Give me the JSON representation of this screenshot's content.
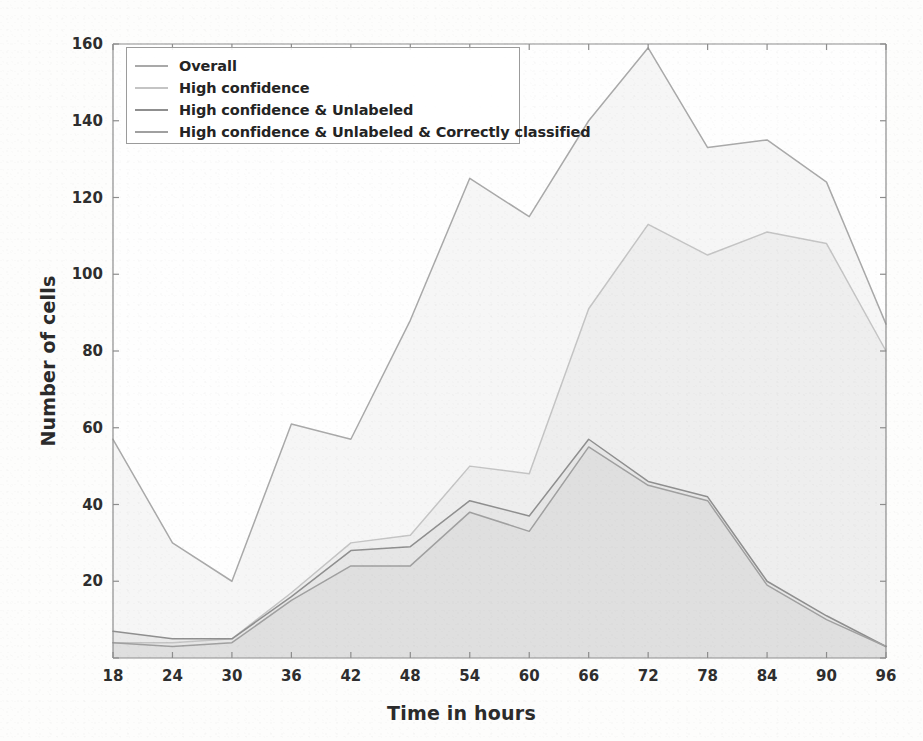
{
  "figure": {
    "background_color": "#fdfdfc",
    "axes_color": "#8d8d8d",
    "tick_text_color": "#2e2e2e"
  },
  "legend": {
    "position": "upper-left",
    "border_color": "#9b9b9b",
    "entries": [
      {
        "label": "Overall",
        "color": "#a9a9a9"
      },
      {
        "label": "High confidence",
        "color": "#c4c4c4"
      },
      {
        "label": "High confidence & Unlabeled",
        "color": "#8f8f8f"
      },
      {
        "label": "High confidence & Unlabeled & Correctly classified",
        "color": "#a0a0a0"
      }
    ]
  },
  "chart_data": {
    "type": "area",
    "title": "",
    "xlabel": "Time in hours",
    "ylabel": "Number of cells",
    "xlim": [
      18,
      96
    ],
    "ylim": [
      0,
      160
    ],
    "xticks": [
      18,
      24,
      30,
      36,
      42,
      48,
      54,
      60,
      66,
      72,
      78,
      84,
      90,
      96
    ],
    "yticks": [
      0,
      20,
      40,
      60,
      80,
      100,
      120,
      140,
      160
    ],
    "xtick_labels": [
      "18",
      "24",
      "30",
      "36",
      "42",
      "48",
      "54",
      "60",
      "66",
      "72",
      "78",
      "84",
      "90",
      "96"
    ],
    "ytick_labels": [
      "0",
      "20",
      "40",
      "60",
      "80",
      "100",
      "120",
      "140",
      "160"
    ],
    "grid": false,
    "legend_position": "upper left",
    "x": [
      18,
      24,
      30,
      36,
      42,
      48,
      54,
      60,
      66,
      72,
      78,
      84,
      90,
      96
    ],
    "series": [
      {
        "name": "Overall",
        "color": "#a9a9a9",
        "fill": "#f2f2f2",
        "values": [
          57,
          30,
          20,
          61,
          57,
          88,
          125,
          115,
          140,
          159,
          133,
          135,
          124,
          87
        ]
      },
      {
        "name": "High confidence",
        "color": "#c4c4c4",
        "fill": "#eaeaea",
        "values": [
          4,
          4,
          5,
          17,
          30,
          32,
          50,
          48,
          91,
          113,
          105,
          111,
          108,
          80
        ]
      },
      {
        "name": "High confidence & Unlabeled",
        "color": "#8f8f8f",
        "fill": "#e3e3e3",
        "values": [
          7,
          5,
          5,
          16,
          28,
          29,
          41,
          37,
          57,
          46,
          42,
          20,
          11,
          3
        ]
      },
      {
        "name": "High confidence & Unlabeled & Correctly classified",
        "color": "#a0a0a0",
        "fill": "#dddddd",
        "values": [
          4,
          3,
          4,
          15,
          24,
          24,
          38,
          33,
          55,
          45,
          41,
          19,
          10,
          3
        ]
      }
    ]
  }
}
